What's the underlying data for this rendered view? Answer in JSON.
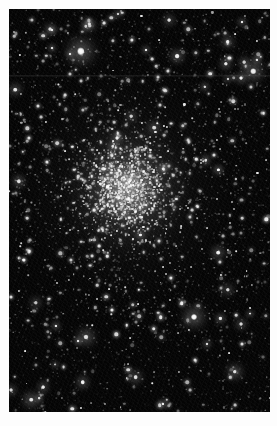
{
  "image": {
    "title": "Globular star cluster",
    "subject_name": "globular-cluster",
    "caption": "",
    "medium": "grayscale astronomical photograph",
    "width_px": 277,
    "height_px": 426,
    "plate": {
      "x": 9,
      "y": 9,
      "width": 261,
      "height": 403,
      "background_color": "#050505",
      "page_margin_color": "#ffffff"
    },
    "colors": {
      "page_background": "#ffffff",
      "sky_background": "#050505",
      "star_color": "#ffffff",
      "core_glow": "#e8e8e8",
      "halo_glow": "#787878"
    },
    "cluster": {
      "label": "cluster-core",
      "center_x_pct": 45.5,
      "center_y_pct": 44.5,
      "core_radius_px": 26,
      "halo_radius_px": 150,
      "description": "dense unresolved core with resolved member stars fading into a broad halo"
    },
    "artifacts": [
      {
        "name": "horizontal-scanline",
        "y_px": 66,
        "height_px": 2
      }
    ],
    "notable_objects": [
      {
        "name": "bright-fuzzy-star-upper-left",
        "x_pct": 27.5,
        "y_pct": 10.5,
        "size_px": 7.5,
        "brightness": 1.0
      },
      {
        "name": "bright-star-right-upper",
        "x_pct": 93.5,
        "y_pct": 15.5,
        "size_px": 5.5,
        "brightness": 0.95
      },
      {
        "name": "bright-star-lower-left",
        "x_pct": 71.0,
        "y_pct": 76.5,
        "size_px": 6.0,
        "brightness": 1.0
      },
      {
        "name": "bright-star-bottom-center",
        "x_pct": 29.5,
        "y_pct": 81.5,
        "size_px": 5.0,
        "brightness": 0.9
      },
      {
        "name": "bright-star-bottom-right",
        "x_pct": 86.5,
        "y_pct": 90.0,
        "size_px": 4.5,
        "brightness": 0.9
      },
      {
        "name": "bright-star-bottom-left-corner",
        "x_pct": 8.5,
        "y_pct": 97.0,
        "size_px": 4.5,
        "brightness": 0.9
      }
    ],
    "star_counts": {
      "field_stars": 1100,
      "cluster_member_stars": 1400,
      "bright_foreground_stars": 48
    }
  }
}
